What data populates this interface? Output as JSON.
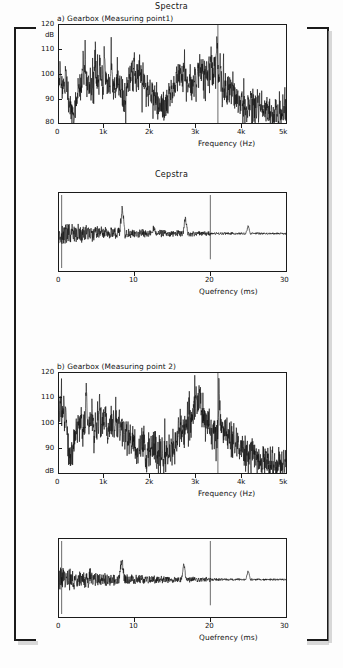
{
  "figure": {
    "title": "Spectra",
    "background_color": "#fdfdfd",
    "ink_color": "#101010"
  },
  "brackets": {
    "left_name": "left-square-bracket",
    "right_name": "right-square-bracket"
  },
  "charts": [
    {
      "id": "spectrum-a",
      "title": "Spectra",
      "sublabel": "a) Gearbox (Measuring point1)",
      "yticks": [
        "120",
        "dB",
        "110",
        "100",
        "90",
        "80"
      ],
      "xticks": [
        "0",
        "1k",
        "2k",
        "3k",
        "4k",
        "5k"
      ],
      "xcaption": "Frequency (Hz)"
    },
    {
      "id": "cepstrum-a",
      "title": "Cepstra",
      "sublabel": "",
      "yticks": [],
      "xticks": [
        "0",
        "10",
        "20",
        "30"
      ],
      "xcaption": "Quefrency (ms)"
    },
    {
      "id": "spectrum-b",
      "title": "",
      "sublabel": "b) Gearbox (Measuring point 2)",
      "yticks": [
        "120",
        "110",
        "100",
        "90",
        "dB"
      ],
      "xticks": [
        "0",
        "1k",
        "2k",
        "3k",
        "4k",
        "5k"
      ],
      "xcaption": "Frequency (Hz)"
    },
    {
      "id": "cepstrum-b",
      "title": "",
      "sublabel": "",
      "yticks": [],
      "xticks": [
        "0",
        "10",
        "20",
        "30"
      ],
      "xcaption": "Quefrency (ms)"
    }
  ],
  "chart_data": [
    {
      "type": "line",
      "id": "spectrum-a",
      "title": "a) Gearbox (Measuring point1)",
      "xlabel": "Frequency (Hz)",
      "ylabel": "dB",
      "xlim": [
        0,
        5000
      ],
      "ylim": [
        80,
        120
      ],
      "xtick_values": [
        0,
        1000,
        2000,
        3000,
        4000,
        5000
      ],
      "xtick_labels": [
        "0",
        "1k",
        "2k",
        "3k",
        "4k",
        "5k"
      ],
      "ytick_values": [
        80,
        90,
        100,
        110,
        120
      ],
      "ytick_labels": [
        "80",
        "90",
        "100",
        "110",
        "120"
      ],
      "grid": false,
      "legend": "none",
      "annotations": [
        "vertical marker near 3.5 kHz reaching 120 dB"
      ],
      "x": [
        0,
        25,
        50,
        75,
        100,
        125,
        150,
        175,
        200,
        225,
        250,
        275,
        300,
        325,
        350,
        375,
        400,
        425,
        450,
        475,
        500,
        525,
        550,
        575,
        600,
        625,
        650,
        675,
        700,
        725,
        750,
        775,
        800,
        825,
        850,
        875,
        900,
        925,
        950,
        975,
        1000,
        1025,
        1050,
        1075,
        1100,
        1125,
        1150,
        1175,
        1200,
        1225,
        1250,
        1275,
        1300,
        1325,
        1350,
        1375,
        1400,
        1425,
        1450,
        1475,
        1500,
        1525,
        1550,
        1575,
        1600,
        1625,
        1650,
        1675,
        1700,
        1725,
        1750,
        1775,
        1800,
        1825,
        1850,
        1875,
        1900,
        1925,
        1950,
        1975,
        2000,
        2025,
        2050,
        2075,
        2100,
        2125,
        2150,
        2175,
        2200,
        2225,
        2250,
        2275,
        2300,
        2325,
        2350,
        2375,
        2400,
        2425,
        2450,
        2475,
        2500,
        2525,
        2550,
        2575,
        2600,
        2625,
        2650,
        2675,
        2700,
        2725,
        2750,
        2775,
        2800,
        2825,
        2850,
        2875,
        2900,
        2925,
        2950,
        2975,
        3000,
        3025,
        3050,
        3075,
        3100,
        3125,
        3150,
        3175,
        3200,
        3225,
        3250,
        3275,
        3300,
        3325,
        3350,
        3375,
        3400,
        3425,
        3450,
        3475,
        3500,
        3525,
        3550,
        3575,
        3600,
        3625,
        3650,
        3675,
        3700,
        3725,
        3750,
        3775,
        3800,
        3825,
        3850,
        3875,
        3900,
        3925,
        3950,
        3975,
        4000,
        4025,
        4050,
        4075,
        4100,
        4125,
        4150,
        4175,
        4200,
        4225,
        4250,
        4275,
        4300,
        4325,
        4350,
        4375,
        4400,
        4425,
        4450,
        4475,
        4500,
        4525,
        4550,
        4575,
        4600,
        4625,
        4650,
        4675,
        4700,
        4725,
        4750,
        4775,
        4800,
        4825,
        4850,
        4875,
        4900,
        4925,
        4950,
        4975,
        5000
      ],
      "y": [
        97,
        101,
        97,
        93,
        99,
        95,
        100,
        96,
        92,
        89,
        86,
        83,
        85,
        81,
        86,
        90,
        88,
        95,
        92,
        97,
        94,
        109,
        99,
        104,
        95,
        94,
        97,
        95,
        93,
        96,
        94,
        98,
        110,
        96,
        101,
        93,
        106,
        95,
        97,
        93,
        111,
        99,
        95,
        92,
        96,
        94,
        110,
        96,
        93,
        97,
        92,
        99,
        95,
        96,
        92,
        95,
        91,
        88,
        93,
        90,
        96,
        94,
        100,
        97,
        103,
        99,
        105,
        101,
        98,
        102,
        97,
        104,
        100,
        96,
        99,
        94,
        97,
        93,
        96,
        92,
        95,
        90,
        93,
        88,
        92,
        87,
        91,
        86,
        90,
        84,
        88,
        83,
        87,
        82,
        86,
        90,
        85,
        92,
        88,
        94,
        90,
        96,
        92,
        99,
        95,
        101,
        97,
        103,
        99,
        96,
        101,
        97,
        93,
        98,
        94,
        99,
        95,
        92,
        97,
        93,
        99,
        95,
        101,
        98,
        104,
        100,
        103,
        99,
        102,
        98,
        103,
        100,
        105,
        101,
        106,
        102,
        100,
        104,
        99,
        114,
        102,
        98,
        103,
        99,
        94,
        98,
        93,
        97,
        92,
        96,
        91,
        95,
        90,
        94,
        89,
        93,
        88,
        92,
        87,
        91,
        86,
        90,
        85,
        89,
        84,
        88,
        86,
        90,
        85,
        89,
        84,
        88,
        83,
        87,
        85,
        89,
        84,
        88,
        83,
        87,
        82,
        86,
        84,
        88,
        83,
        87,
        82,
        86,
        81,
        85,
        83,
        87,
        82,
        86,
        81,
        85,
        83,
        87,
        82,
        86,
        84,
        88,
        83
      ]
    },
    {
      "type": "line",
      "id": "cepstrum-a",
      "title": "Cepstra",
      "xlabel": "Quefrency (ms)",
      "ylabel": "",
      "xlim": [
        0,
        30
      ],
      "ylim": [
        -1,
        1
      ],
      "xtick_values": [
        0,
        10,
        20,
        30
      ],
      "xtick_labels": [
        "0",
        "10",
        "20",
        "30"
      ],
      "grid": false,
      "legend": "none",
      "annotations": [
        "large positive rahmonic peak near 8.3 ms",
        "secondary peak near 16.7 ms",
        "large downward spike near 20 ms",
        "small peak near 25 ms"
      ]
    },
    {
      "type": "line",
      "id": "spectrum-b",
      "title": "b) Gearbox (Measuring point 2)",
      "xlabel": "Frequency (Hz)",
      "ylabel": "dB",
      "xlim": [
        0,
        5000
      ],
      "ylim": [
        80,
        120
      ],
      "xtick_values": [
        0,
        1000,
        2000,
        3000,
        4000,
        5000
      ],
      "xtick_labels": [
        "0",
        "1k",
        "2k",
        "3k",
        "4k",
        "5k"
      ],
      "ytick_values": [
        80,
        90,
        100,
        110,
        120
      ],
      "ytick_labels": [
        "dB",
        "90",
        "100",
        "110",
        "120"
      ],
      "grid": false,
      "legend": "none",
      "annotations": [
        "vertical marker near 3.5 kHz reaching 120 dB"
      ],
      "x": [
        0,
        25,
        50,
        75,
        100,
        125,
        150,
        175,
        200,
        225,
        250,
        275,
        300,
        325,
        350,
        375,
        400,
        425,
        450,
        475,
        500,
        525,
        550,
        575,
        600,
        625,
        650,
        675,
        700,
        725,
        750,
        775,
        800,
        825,
        850,
        875,
        900,
        925,
        950,
        975,
        1000,
        1025,
        1050,
        1075,
        1100,
        1125,
        1150,
        1175,
        1200,
        1225,
        1250,
        1275,
        1300,
        1325,
        1350,
        1375,
        1400,
        1425,
        1450,
        1475,
        1500,
        1525,
        1550,
        1575,
        1600,
        1625,
        1650,
        1675,
        1700,
        1725,
        1750,
        1775,
        1800,
        1825,
        1850,
        1875,
        1900,
        1925,
        1950,
        1975,
        2000,
        2025,
        2050,
        2075,
        2100,
        2125,
        2150,
        2175,
        2200,
        2225,
        2250,
        2275,
        2300,
        2325,
        2350,
        2375,
        2400,
        2425,
        2450,
        2475,
        2500,
        2525,
        2550,
        2575,
        2600,
        2625,
        2650,
        2675,
        2700,
        2725,
        2750,
        2775,
        2800,
        2825,
        2850,
        2875,
        2900,
        2925,
        2950,
        2975,
        3000,
        3025,
        3050,
        3075,
        3100,
        3125,
        3150,
        3175,
        3200,
        3225,
        3250,
        3275,
        3300,
        3325,
        3350,
        3375,
        3400,
        3425,
        3450,
        3475,
        3500,
        3525,
        3550,
        3575,
        3600,
        3625,
        3650,
        3675,
        3700,
        3725,
        3750,
        3775,
        3800,
        3825,
        3850,
        3875,
        3900,
        3925,
        3950,
        3975,
        4000,
        4025,
        4050,
        4075,
        4100,
        4125,
        4150,
        4175,
        4200,
        4225,
        4250,
        4275,
        4300,
        4325,
        4350,
        4375,
        4400,
        4425,
        4450,
        4475,
        4500,
        4525,
        4550,
        4575,
        4600,
        4625,
        4650,
        4675,
        4700,
        4725,
        4750,
        4775,
        4800,
        4825,
        4850,
        4875,
        4900,
        4925,
        4950,
        4975,
        5000
      ],
      "y": [
        110,
        104,
        108,
        101,
        106,
        99,
        103,
        96,
        92,
        88,
        86,
        90,
        87,
        94,
        91,
        98,
        95,
        102,
        97,
        104,
        99,
        96,
        101,
        98,
        117,
        102,
        97,
        103,
        98,
        104,
        99,
        96,
        101,
        97,
        103,
        99,
        110,
        101,
        96,
        102,
        97,
        103,
        98,
        95,
        100,
        96,
        101,
        97,
        102,
        98,
        104,
        99,
        96,
        100,
        95,
        99,
        94,
        98,
        93,
        97,
        92,
        96,
        91,
        95,
        90,
        94,
        89,
        93,
        85,
        90,
        86,
        92,
        88,
        94,
        90,
        96,
        86,
        82,
        86,
        90,
        85,
        91,
        87,
        93,
        88,
        94,
        83,
        88,
        84,
        89,
        85,
        91,
        82,
        87,
        83,
        89,
        85,
        91,
        86,
        92,
        88,
        94,
        90,
        96,
        92,
        98,
        94,
        99,
        95,
        101,
        96,
        102,
        97,
        103,
        98,
        104,
        99,
        105,
        101,
        107,
        103,
        109,
        105,
        111,
        107,
        114,
        104,
        99,
        103,
        98,
        102,
        97,
        101,
        96,
        100,
        95,
        99,
        94,
        98,
        93,
        97,
        118,
        101,
        96,
        100,
        95,
        99,
        94,
        98,
        93,
        97,
        92,
        96,
        91,
        95,
        90,
        94,
        89,
        93,
        88,
        92,
        87,
        91,
        86,
        90,
        85,
        89,
        84,
        88,
        86,
        90,
        85,
        89,
        84,
        88,
        83,
        87,
        82,
        86,
        84,
        88,
        83,
        87,
        82,
        86,
        81,
        85,
        83,
        87,
        82,
        86,
        81,
        85,
        83,
        87,
        82,
        86,
        81,
        85,
        83,
        87,
        82,
        86,
        84
      ]
    },
    {
      "type": "line",
      "id": "cepstrum-b",
      "title": "",
      "xlabel": "Quefrency (ms)",
      "ylabel": "",
      "xlim": [
        0,
        30
      ],
      "ylim": [
        -1,
        1
      ],
      "xtick_values": [
        0,
        10,
        20,
        30
      ],
      "xtick_labels": [
        "0",
        "10",
        "20",
        "30"
      ],
      "grid": false,
      "legend": "none",
      "annotations": [
        "rahmonic peak near 8.3 ms",
        "peak near 16.5 ms",
        "large downward spike near 20 ms",
        "small peak near 25 ms"
      ]
    }
  ]
}
